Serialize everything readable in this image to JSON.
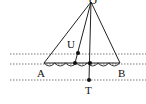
{
  "diagram": {
    "labels": {
      "apex": "O",
      "left": "A",
      "right": "B",
      "upper_point": "U",
      "lower_point": "T"
    },
    "colors": {
      "line": "#222222",
      "dotted": "#555555",
      "background": "#ffffff"
    },
    "points": {
      "O": [
        91,
        1
      ],
      "A": [
        44,
        63
      ],
      "B": [
        120,
        63
      ],
      "U": [
        78,
        53
      ],
      "M1": [
        75,
        63
      ],
      "M2": [
        90,
        63
      ],
      "T": [
        89,
        80
      ]
    },
    "dotted_lines_y": [
      54,
      64,
      80
    ],
    "scallop_count": 7
  }
}
